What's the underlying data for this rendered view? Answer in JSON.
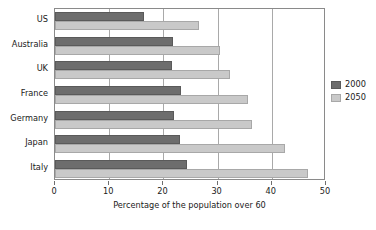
{
  "chart_data": {
    "type": "bar",
    "orientation": "horizontal",
    "title": "",
    "xlabel": "Percentage of the population over 60",
    "ylabel": "",
    "xlim": [
      0,
      50
    ],
    "xticks": [
      0,
      10,
      20,
      30,
      40,
      50
    ],
    "xtick_labels": [
      "0",
      "10",
      "20",
      "30",
      "40",
      "50"
    ],
    "grid": "vertical",
    "legend_position": "right",
    "categories": [
      "US",
      "Australia",
      "UK",
      "France",
      "Germany",
      "Japan",
      "Italy"
    ],
    "series": [
      {
        "name": "2000",
        "color": "#6d6d6d",
        "values": [
          16.5,
          21.7,
          21.5,
          23.2,
          22.0,
          23.0,
          24.3
        ]
      },
      {
        "name": "2050",
        "color": "#c9c9c9",
        "values": [
          26.5,
          30.4,
          32.2,
          35.6,
          36.3,
          42.4,
          46.7
        ]
      }
    ]
  },
  "legend": {
    "items": [
      {
        "label": "2000"
      },
      {
        "label": "2050"
      }
    ]
  },
  "colors": {
    "series_2000": "#6d6d6d",
    "series_2050": "#c9c9c9",
    "axis": "#8a8a8a",
    "gridline": "#a9a9a9",
    "text": "#1a1a1a",
    "background": "#ffffff"
  }
}
